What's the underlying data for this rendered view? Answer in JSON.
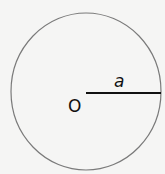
{
  "diagram": {
    "type": "circle-with-radius",
    "center_label": "O",
    "radius_label": "a",
    "colors": {
      "background": "#f5f5f4",
      "circle_stroke": "#7a7a7a",
      "radius_stroke": "#111111",
      "text": "#111111"
    }
  }
}
